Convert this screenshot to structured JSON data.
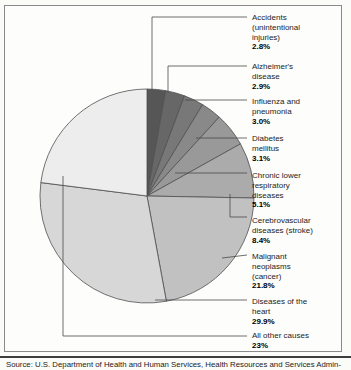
{
  "source": {
    "text": "Source: U.S. Department of Health and Human Services, Health Resources and Services Admin-"
  },
  "chart_data": {
    "type": "pie",
    "unit": "percent of deaths",
    "direction": "clockwise",
    "start_angle_deg": 0,
    "legend_position": "right-labels-with-leader-lines",
    "center": [
      147,
      196
    ],
    "radius": 107,
    "rim_color": "#4f4f4f",
    "separator_color": "#4f4f4f",
    "leader_color": "#4a4a4a",
    "categories": [
      "Accidents (unintentional injuries)",
      "Alzheimer's disease",
      "Influenza and pneumonia",
      "Diabetes mellitus",
      "Chronic lower respiratory diseases",
      "Cerebrovascular diseases (stroke)",
      "Malignant neoplasms (cancer)",
      "Diseases of the heart",
      "All other causes"
    ],
    "values": [
      2.8,
      2.9,
      3.0,
      3.1,
      5.1,
      8.4,
      21.8,
      29.9,
      23
    ],
    "slices": [
      {
        "label_lines": [
          "Accidents",
          "(unintentional",
          "injuries)"
        ],
        "pct": "2.8%",
        "value": 2.8,
        "color": "#565656",
        "label_top": 13,
        "leader": [
          [
            152,
            90
          ],
          [
            152,
            17
          ],
          [
            247,
            17
          ]
        ]
      },
      {
        "label_lines": [
          "Alzheimer's",
          "disease"
        ],
        "pct": "2.9%",
        "value": 2.9,
        "color": "#676767",
        "label_top": 62,
        "leader": [
          [
            168,
            93
          ],
          [
            168,
            66
          ],
          [
            247,
            66
          ]
        ]
      },
      {
        "label_lines": [
          "Influenza and",
          "pneumonia"
        ],
        "pct": "3.0%",
        "value": 3.0,
        "color": "#787878",
        "label_top": 97,
        "leader": [
          [
            185,
            100
          ],
          [
            247,
            100
          ]
        ]
      },
      {
        "label_lines": [
          "Diabetes",
          "mellitus"
        ],
        "pct": "3.1%",
        "value": 3.1,
        "color": "#898989",
        "label_top": 134,
        "leader": [
          [
            196,
            138
          ],
          [
            247,
            138
          ]
        ]
      },
      {
        "label_lines": [
          "Chronic lower",
          "respiratory",
          "diseases"
        ],
        "pct": "5.1%",
        "value": 5.1,
        "color": "#999999",
        "label_top": 171,
        "leader": [
          [
            175,
            173
          ],
          [
            247,
            173
          ]
        ]
      },
      {
        "label_lines": [
          "Cerebrovascular",
          "diseases (stroke)"
        ],
        "pct": "8.4%",
        "value": 8.4,
        "color": "#ababab",
        "label_top": 216,
        "leader": [
          [
            230,
            194
          ],
          [
            230,
            217
          ],
          [
            247,
            217
          ]
        ]
      },
      {
        "label_lines": [
          "Malignant",
          "neoplasms",
          "(cancer)"
        ],
        "pct": "21.8%",
        "value": 21.8,
        "color": "#c1c1c1",
        "label_top": 252,
        "leader": [
          [
            222,
            258
          ],
          [
            247,
            255
          ]
        ]
      },
      {
        "label_lines": [
          "Diseases of the",
          "heart"
        ],
        "pct": "29.9%",
        "value": 29.9,
        "color": "#d7d7d7",
        "label_top": 297,
        "leader": [
          [
            155,
            300
          ],
          [
            247,
            300
          ]
        ]
      },
      {
        "label_lines": [
          "All other causes"
        ],
        "pct": "23%",
        "value": 23,
        "color": "#ededed",
        "label_top": 331,
        "leader": [
          [
            63,
            176
          ],
          [
            63,
            336
          ],
          [
            247,
            336
          ]
        ]
      }
    ]
  }
}
